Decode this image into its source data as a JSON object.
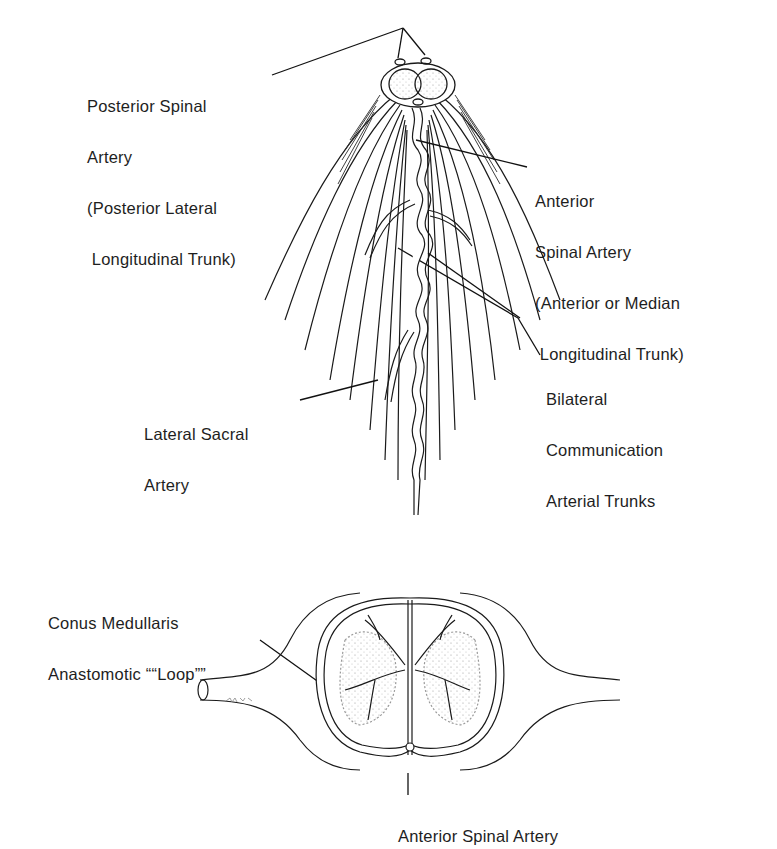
{
  "figure": {
    "title": "",
    "upper_panel": {
      "description": "Spinal cord conus and cauda equina, posterior/anterior arterial supply",
      "labels": [
        {
          "id": "posterior_spinal_artery",
          "lines": [
            "Posterior Spinal",
            "Artery",
            "(Posterior Lateral",
            " Longitudinal Trunk)"
          ]
        },
        {
          "id": "anterior_spinal_artery_upper",
          "lines": [
            "Anterior",
            "Spinal Artery",
            "(Anterior or Median",
            " Longitudinal Trunk)"
          ]
        },
        {
          "id": "bilateral_communication",
          "lines": [
            "Bilateral",
            "Communication",
            "Arterial Trunks"
          ]
        },
        {
          "id": "lateral_sacral_artery",
          "lines": [
            "Lateral Sacral",
            "Artery"
          ]
        }
      ]
    },
    "lower_panel": {
      "description": "Cross-section of conus medullaris showing anastomotic loop",
      "labels": [
        {
          "id": "conus_loop",
          "lines": [
            "Conus Medullaris",
            "Anastomotic ““Loop””"
          ]
        },
        {
          "id": "anterior_spinal_artery_lower",
          "lines": [
            "Anterior Spinal Artery"
          ]
        }
      ],
      "signature": "~scribble~"
    },
    "colors": {
      "line": "#1a1a1a",
      "stipple": "#9a9a9a",
      "background": "#ffffff"
    }
  }
}
